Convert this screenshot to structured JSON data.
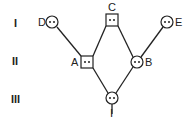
{
  "diagram": {
    "type": "pedigree",
    "generations": [
      "I",
      "II",
      "III"
    ],
    "individuals": [
      {
        "id": "D",
        "label": "D",
        "shape": "circle",
        "sex": "female",
        "generation": "I",
        "marker": "two-dots"
      },
      {
        "id": "C",
        "label": "C",
        "shape": "square",
        "sex": "male",
        "generation": "I",
        "marker": "two-dots"
      },
      {
        "id": "E",
        "label": "E",
        "shape": "circle",
        "sex": "female",
        "generation": "I",
        "marker": "two-dots"
      },
      {
        "id": "A",
        "label": "A",
        "shape": "square",
        "sex": "male",
        "generation": "II",
        "marker": "two-dots"
      },
      {
        "id": "B",
        "label": "B",
        "shape": "circle",
        "sex": "female",
        "generation": "II",
        "marker": "two-dots"
      },
      {
        "id": "I",
        "label": "I",
        "shape": "circle",
        "sex": "female",
        "generation": "III",
        "marker": "two-dots"
      }
    ],
    "edges": [
      {
        "from": "D",
        "to": "A"
      },
      {
        "from": "C",
        "to": "A"
      },
      {
        "from": "C",
        "to": "B"
      },
      {
        "from": "E",
        "to": "B"
      },
      {
        "from": "A",
        "to": "I"
      },
      {
        "from": "B",
        "to": "I"
      }
    ],
    "colors": {
      "stroke": "#222222",
      "fill": "#ffffff"
    }
  }
}
